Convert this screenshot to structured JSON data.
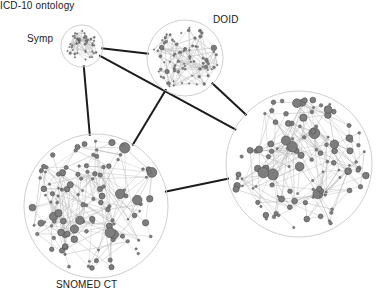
{
  "figure": {
    "type": "network-graph",
    "background": "#ffffff",
    "width": 384,
    "height": 307
  },
  "style": {
    "node_fill": "#7d7d7d",
    "node_stroke": "#565656",
    "intra_edge": "#b4b4b4",
    "inter_edge": "#1c1c1c",
    "cluster_outline": "#c8c8c8",
    "label_color": "#1a1a1a"
  },
  "clusters": [
    {
      "id": "symp",
      "label": "Symp",
      "cx": 82,
      "cy": 46,
      "r": 21,
      "node_count": 46,
      "node_scale": 0.34,
      "density": 0.2,
      "label_position": "left",
      "seed": 11
    },
    {
      "id": "doid",
      "label": "DOID",
      "cx": 185,
      "cy": 58,
      "r": 38,
      "node_count": 82,
      "node_scale": 0.62,
      "density": 0.13,
      "label_position": "top-right",
      "seed": 27
    },
    {
      "id": "snomed",
      "label": "SNOMED CT",
      "cx": 96,
      "cy": 206,
      "r": 72,
      "node_count": 118,
      "node_scale": 1.0,
      "density": 0.085,
      "label_position": "bottom",
      "seed": 43
    },
    {
      "id": "icd10",
      "label": "ICD-10 ontology",
      "cx": 299,
      "cy": 164,
      "r": 73,
      "node_count": 116,
      "node_scale": 1.0,
      "density": 0.085,
      "label_position": "bottom",
      "seed": 61
    }
  ],
  "inter_edges": [
    {
      "from": "symp",
      "to": "doid",
      "width": 2.0
    },
    {
      "from": "symp",
      "to": "snomed",
      "width": 2.0
    },
    {
      "from": "symp",
      "to": "icd10",
      "width": 2.0
    },
    {
      "from": "doid",
      "to": "snomed",
      "width": 2.0
    },
    {
      "from": "doid",
      "to": "icd10",
      "width": 2.0
    },
    {
      "from": "snomed",
      "to": "icd10",
      "width": 2.0
    }
  ],
  "chart_data": {
    "type": "scatter",
    "title": "",
    "xlabel": "",
    "ylabel": "",
    "legend": [],
    "categories": [
      "Symp",
      "DOID",
      "SNOMED CT",
      "ICD-10 ontology"
    ],
    "values": [
      46,
      82,
      118,
      116
    ],
    "series": [
      {
        "name": "nodes per ontology cluster",
        "values": [
          46,
          82,
          118,
          116
        ]
      },
      {
        "name": "cluster radius (px)",
        "values": [
          21,
          38,
          72,
          73
        ]
      }
    ],
    "annotations": [
      "Symp",
      "DOID",
      "SNOMED CT",
      "ICD-10 ontology"
    ]
  }
}
